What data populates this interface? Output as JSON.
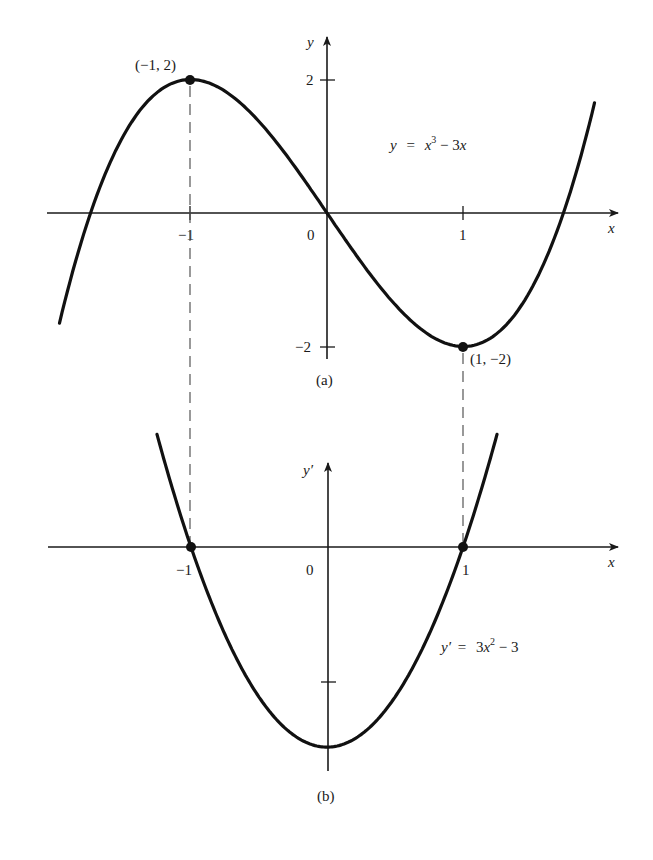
{
  "chart_data": [
    {
      "type": "line",
      "panel": "(a)",
      "function": "y = x^3 - 3x",
      "equation_label": {
        "lhs": "y",
        "eq": "=",
        "x": "x",
        "exp": "3",
        "rest": " − 3",
        "x2": "x"
      },
      "xlabel": "x",
      "ylabel": "y",
      "x_ticks": [
        {
          "value": -1,
          "label": "−1"
        },
        {
          "value": 0,
          "label": "0"
        },
        {
          "value": 1,
          "label": "1"
        }
      ],
      "y_ticks": [
        {
          "value": 2,
          "label": "2"
        },
        {
          "value": -2,
          "label": "−2"
        }
      ],
      "xlim": [
        -2.05,
        2.1
      ],
      "ylim": [
        -2.3,
        2.2
      ],
      "x_range_plotted": [
        -1.96,
        1.96
      ],
      "critical_points": [
        {
          "x": -1,
          "y": 2,
          "label": "(−1, 2)",
          "kind": "local max"
        },
        {
          "x": 1,
          "y": -2,
          "label": "(1, −2)",
          "kind": "local min"
        }
      ],
      "sample_points": {
        "x": [
          -1.96,
          -1.73,
          -1.5,
          -1,
          -0.5,
          0,
          0.5,
          1,
          1.5,
          1.73,
          1.96
        ],
        "y": [
          -1.65,
          0.0,
          1.125,
          2.0,
          1.375,
          0.0,
          -1.375,
          -2.0,
          -1.125,
          0.0,
          1.65
        ]
      },
      "grid": false
    },
    {
      "type": "line",
      "panel": "(b)",
      "function": "y' = 3x^2 - 3",
      "equation_label": {
        "lhs": "y′",
        "eq": "=",
        "coef": "3",
        "x": "x",
        "exp": "2",
        "rest": " − 3"
      },
      "xlabel": "x",
      "ylabel": "y′",
      "x_ticks": [
        {
          "value": -1,
          "label": "−1"
        },
        {
          "value": 0,
          "label": "0"
        },
        {
          "value": 1,
          "label": "1"
        }
      ],
      "y_ticks": [
        {
          "value": -2,
          "label": ""
        }
      ],
      "xlim": [
        -2.05,
        2.1
      ],
      "ylim": [
        -3.4,
        1.3
      ],
      "x_range_plotted": [
        -1.25,
        1.25
      ],
      "zeros": [
        {
          "x": -1,
          "y": 0
        },
        {
          "x": 1,
          "y": 0
        }
      ],
      "minimum": {
        "x": 0,
        "y": -3
      },
      "sample_points": {
        "x": [
          -1.25,
          -1,
          -0.5,
          0,
          0.5,
          1,
          1.25
        ],
        "y": [
          1.69,
          0.0,
          -2.25,
          -3.0,
          -2.25,
          0.0,
          1.69
        ]
      },
      "grid": false
    }
  ],
  "figure": {
    "panel_a": {
      "caption": "(a)",
      "y_axis_label": "y",
      "x_axis_label": "x",
      "tick_x_neg1": "−1",
      "tick_x_0": "0",
      "tick_x_1": "1",
      "tick_y_2": "2",
      "tick_y_neg2": "−2",
      "max_point_label": "(−1, 2)",
      "min_point_label": "(1, −2)",
      "equation_lhs": "y",
      "equation_eq": "=",
      "equation_x": "x",
      "equation_exp": "3",
      "equation_rest": " − 3",
      "equation_x2": "x"
    },
    "panel_b": {
      "caption": "(b)",
      "y_axis_label": "y′",
      "x_axis_label": "x",
      "tick_x_neg1": "−1",
      "tick_x_0": "0",
      "tick_x_1": "1",
      "equation_lhs": "y′",
      "equation_eq": "=",
      "equation_coef": "3",
      "equation_x": "x",
      "equation_exp": "2",
      "equation_rest": " − 3"
    },
    "colors": {
      "ink": "#1a1a1a",
      "background": "#ffffff",
      "dash": "#555555"
    }
  }
}
